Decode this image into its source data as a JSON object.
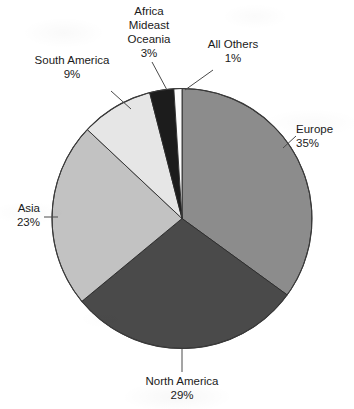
{
  "chart_data": {
    "type": "pie",
    "title": "",
    "subtitle": "",
    "xlabel": "",
    "ylabel": "",
    "legend_position": "none",
    "grid": false,
    "units": "percent",
    "start_angle_deg": 0,
    "direction": "clockwise",
    "categories": [
      "Europe",
      "North America",
      "Asia",
      "South America",
      "Africa Mideast Oceania",
      "All Others"
    ],
    "values": [
      35,
      29,
      23,
      9,
      3,
      1
    ],
    "slices": [
      {
        "name": "Europe",
        "label": "Europe",
        "value": 35,
        "value_text": "35%",
        "color": "#8c8c8c",
        "label_lines": [
          "Europe",
          "35%"
        ],
        "label_anchor": "left",
        "label_x": 296,
        "label_y": 133,
        "leader": {
          "x1": 283,
          "y1": 148,
          "x2": 296,
          "y2": 136
        }
      },
      {
        "name": "North America",
        "label": "North America",
        "value": 29,
        "value_text": "29%",
        "color": "#4a4a4a",
        "label_lines": [
          "North America",
          "29%"
        ],
        "label_anchor": "middle",
        "label_x": 182,
        "label_y": 385,
        "leader": {
          "x1": 182,
          "y1": 349,
          "x2": 182,
          "y2": 372
        }
      },
      {
        "name": "Asia",
        "label": "Asia",
        "value": 23,
        "value_text": "23%",
        "color": "#c2c2c2",
        "label_lines": [
          "Asia",
          "23%"
        ],
        "label_anchor": "right",
        "label_x": 40,
        "label_y": 202,
        "leader": {
          "x1": 44,
          "y1": 217,
          "x2": 58,
          "y2": 217
        }
      },
      {
        "name": "South America",
        "label": "South America",
        "value": 9,
        "value_text": "9%",
        "color": "#e6e6e6",
        "label_lines": [
          "South America",
          "9%"
        ],
        "label_anchor": "middle",
        "label_x": 72,
        "label_y": 79,
        "leader": {
          "x1": 111,
          "y1": 91,
          "x2": 131,
          "y2": 109
        }
      },
      {
        "name": "Africa Mideast Oceania",
        "label": "Africa Mideast Oceania",
        "value": 3,
        "value_text": "3%",
        "color": "#1c1c1c",
        "label_lines": [
          "Africa",
          "Mideast",
          "Oceania",
          "3%"
        ],
        "label_anchor": "middle",
        "label_x": 148,
        "label_y": 13,
        "leader": {
          "x1": 152,
          "y1": 62,
          "x2": 167,
          "y2": 90
        }
      },
      {
        "name": "All Others",
        "label": "All Others",
        "value": 1,
        "value_text": "1%",
        "color": "#fcfcfc",
        "label_lines": [
          "All Others",
          "1%"
        ],
        "label_anchor": "middle",
        "label_x": 233,
        "label_y": 53,
        "leader": {
          "x1": 213,
          "y1": 70,
          "x2": 185,
          "y2": 90
        }
      }
    ]
  },
  "labels": {
    "europe": {
      "line1": "Europe",
      "line2": "35%"
    },
    "north_america": {
      "line1": "North America",
      "line2": "29%"
    },
    "asia": {
      "line1": "Asia",
      "line2": "23%"
    },
    "south_america": {
      "line1": "South America",
      "line2": "9%"
    },
    "africa": {
      "line1": "Africa",
      "line2": "Mideast",
      "line3": "Oceania",
      "line4": "3%"
    },
    "all_others": {
      "line1": "All Others",
      "line2": "1%"
    }
  }
}
